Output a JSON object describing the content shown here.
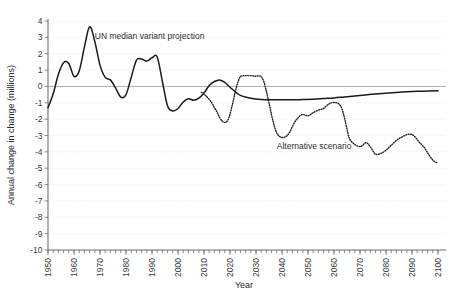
{
  "chart_data": {
    "type": "line",
    "title": "",
    "xlabel": "Year",
    "ylabel": "Annual change in change (millions)",
    "xlim": [
      1950,
      2100
    ],
    "ylim": [
      -10,
      4
    ],
    "grid": true,
    "legend": "inline-annotations",
    "x_ticks": [
      "1950",
      "1960",
      "1970",
      "1980",
      "1990",
      "2000",
      "2010",
      "2020",
      "2030",
      "2040",
      "2050",
      "2060",
      "2070",
      "2080",
      "2090",
      "2100"
    ],
    "y_ticks": [
      "4",
      "3",
      "2",
      "1",
      "0",
      "-1",
      "-2",
      "-3",
      "-4",
      "-5",
      "-6",
      "-7",
      "-8",
      "-9",
      "-10"
    ],
    "series": [
      {
        "name": "UN median variant projection",
        "style": "solid",
        "label_x": 1968,
        "label_y": 2.9,
        "x": [
          1950,
          1952,
          1954,
          1956,
          1958,
          1960,
          1962,
          1964,
          1966,
          1968,
          1970,
          1972,
          1974,
          1976,
          1978,
          1980,
          1982,
          1984,
          1986,
          1988,
          1990,
          1992,
          1994,
          1996,
          1998,
          2000,
          2002,
          2004,
          2006,
          2008,
          2010,
          2012,
          2014,
          2016,
          2018,
          2020,
          2024,
          2028,
          2032,
          2036,
          2040,
          2044,
          2048,
          2052,
          2056,
          2060,
          2064,
          2068,
          2072,
          2076,
          2080,
          2084,
          2088,
          2092,
          2096,
          2100
        ],
        "y": [
          -1.3,
          -0.45,
          0.75,
          1.45,
          1.4,
          0.62,
          0.95,
          2.4,
          3.65,
          2.75,
          1.3,
          0.55,
          0.4,
          -0.1,
          -0.65,
          -0.5,
          0.55,
          1.6,
          1.68,
          1.55,
          1.75,
          1.8,
          0.3,
          -1.2,
          -1.5,
          -1.35,
          -0.95,
          -0.75,
          -0.85,
          -0.72,
          -0.4,
          0.05,
          0.3,
          0.4,
          0.25,
          -0.05,
          -0.55,
          -0.72,
          -0.8,
          -0.82,
          -0.82,
          -0.82,
          -0.8,
          -0.78,
          -0.74,
          -0.7,
          -0.64,
          -0.58,
          -0.52,
          -0.46,
          -0.41,
          -0.37,
          -0.33,
          -0.3,
          -0.28,
          -0.27
        ]
      },
      {
        "name": "Alternative scenario",
        "style": "dotted",
        "label_x": 2038,
        "label_y": -3.85,
        "x": [
          2009,
          2011,
          2013,
          2014,
          2015,
          2016,
          2017,
          2018,
          2019,
          2020,
          2021,
          2022,
          2023,
          2024,
          2025,
          2026,
          2028,
          2030,
          2031,
          2032,
          2033,
          2034,
          2035,
          2036,
          2037,
          2038,
          2039,
          2040,
          2041,
          2042,
          2043,
          2044,
          2045,
          2046,
          2047,
          2048,
          2049,
          2050,
          2051,
          2052,
          2054,
          2056,
          2057,
          2058,
          2059,
          2060,
          2061,
          2062,
          2063,
          2064,
          2065,
          2066,
          2068,
          2070,
          2071,
          2072,
          2073,
          2074,
          2075,
          2076,
          2078,
          2080,
          2082,
          2084,
          2086,
          2088,
          2089,
          2090,
          2091,
          2092,
          2093,
          2094,
          2095,
          2096,
          2097,
          2098,
          2099,
          2100
        ],
        "y": [
          -0.35,
          -0.62,
          -1.0,
          -1.3,
          -1.55,
          -1.9,
          -2.12,
          -2.2,
          -2.1,
          -1.7,
          -1.05,
          -0.35,
          0.25,
          0.6,
          0.65,
          0.66,
          0.66,
          0.62,
          0.65,
          0.6,
          0.3,
          -0.3,
          -1.0,
          -1.75,
          -2.4,
          -2.85,
          -3.05,
          -3.12,
          -3.1,
          -3.0,
          -2.78,
          -2.45,
          -2.15,
          -1.95,
          -1.78,
          -1.72,
          -1.75,
          -1.8,
          -1.72,
          -1.6,
          -1.45,
          -1.35,
          -1.2,
          -1.08,
          -1.0,
          -0.98,
          -1.0,
          -1.08,
          -1.35,
          -1.9,
          -2.6,
          -3.2,
          -3.55,
          -3.68,
          -3.6,
          -3.45,
          -3.5,
          -3.7,
          -3.95,
          -4.15,
          -4.1,
          -3.9,
          -3.6,
          -3.3,
          -3.1,
          -2.95,
          -2.92,
          -2.95,
          -3.05,
          -3.25,
          -3.45,
          -3.6,
          -3.8,
          -4.05,
          -4.3,
          -4.5,
          -4.62,
          -4.68
        ]
      }
    ]
  },
  "axis": {
    "y_title": "Annual change in change (millions)",
    "x_title": "Year"
  }
}
